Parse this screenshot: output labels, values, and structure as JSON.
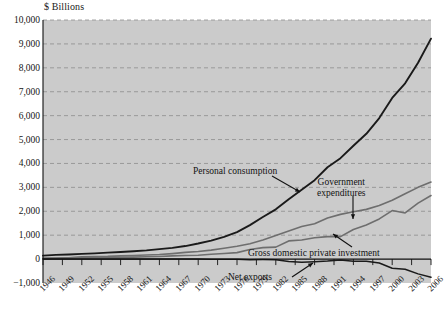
{
  "chart_data": {
    "type": "line",
    "title": "",
    "ylabel": "$ Billions",
    "xlabel": "",
    "ylim": [
      -1000,
      10000
    ],
    "xlim": [
      1946,
      2006
    ],
    "grid": true,
    "legend_position": "inline-annotations",
    "ytick_labels": [
      "10,000",
      "9,000",
      "8,000",
      "7,000",
      "6,000",
      "5,000",
      "4,000",
      "3,000",
      "2,000",
      "1,000",
      "0",
      "−1,000"
    ],
    "ytick_values": [
      10000,
      9000,
      8000,
      7000,
      6000,
      5000,
      4000,
      3000,
      2000,
      1000,
      0,
      -1000
    ],
    "xtick_labels": [
      "1946",
      "1949",
      "1952",
      "1955",
      "1958",
      "1961",
      "1964",
      "1967",
      "1970",
      "1973",
      "1976",
      "1979",
      "1982",
      "1985",
      "1988",
      "1991",
      "1994",
      "1997",
      "2000",
      "2003",
      "2006"
    ],
    "xtick_values": [
      1946,
      1949,
      1952,
      1955,
      1958,
      1961,
      1964,
      1967,
      1970,
      1973,
      1976,
      1979,
      1982,
      1985,
      1988,
      1991,
      1994,
      1997,
      2000,
      2003,
      2006
    ],
    "x": [
      1946,
      1948,
      1950,
      1952,
      1954,
      1956,
      1958,
      1960,
      1962,
      1964,
      1966,
      1968,
      1970,
      1972,
      1974,
      1976,
      1978,
      1980,
      1982,
      1984,
      1986,
      1988,
      1990,
      1992,
      1994,
      1996,
      1998,
      2000,
      2002,
      2004,
      2006
    ],
    "series": [
      {
        "name": "Personal consumption",
        "color": "#1a1a1a",
        "values": [
          145,
          175,
          195,
          220,
          240,
          270,
          295,
          330,
          365,
          415,
          470,
          545,
          650,
          770,
          930,
          1130,
          1420,
          1760,
          2080,
          2500,
          2900,
          3300,
          3840,
          4220,
          4740,
          5240,
          5900,
          6740,
          7350,
          8210,
          9220
        ]
      },
      {
        "name": "Government expenditures",
        "color": "#6e6e6e",
        "values": [
          30,
          38,
          50,
          95,
          110,
          115,
          135,
          150,
          170,
          190,
          230,
          280,
          320,
          375,
          455,
          540,
          640,
          800,
          990,
          1180,
          1360,
          1480,
          1720,
          1870,
          1980,
          2080,
          2240,
          2460,
          2730,
          3000,
          3220
        ]
      },
      {
        "name": "Gross domestic private investment",
        "color": "#6e6e6e",
        "values": [
          35,
          48,
          58,
          62,
          65,
          75,
          70,
          82,
          95,
          110,
          135,
          150,
          160,
          200,
          235,
          270,
          400,
          480,
          500,
          760,
          800,
          890,
          940,
          940,
          1240,
          1430,
          1680,
          2030,
          1930,
          2340,
          2660
        ]
      },
      {
        "name": "Net exports",
        "color": "#1a1a1a",
        "values": [
          8,
          6,
          2,
          3,
          2,
          5,
          1,
          4,
          4,
          7,
          4,
          1,
          4,
          -3,
          -2,
          -4,
          -24,
          -20,
          -27,
          -102,
          -132,
          -107,
          -78,
          -35,
          -93,
          -95,
          -164,
          -380,
          -424,
          -618,
          -762
        ]
      }
    ],
    "annotations": [
      {
        "name": "personal-consumption",
        "text": "Personal consumption"
      },
      {
        "name": "government-expenditures",
        "text": "Government expenditures"
      },
      {
        "name": "gross-domestic-private-investment",
        "text": "Gross domestic private investment"
      },
      {
        "name": "net-exports",
        "text": "Net exports"
      }
    ]
  },
  "annotation_text": {
    "personal_consumption": "Personal consumption",
    "government_expenditures_line1": "Government",
    "government_expenditures_line2": "expenditures",
    "gross_domestic_private_investment": "Gross domestic private investment",
    "net_exports": "Net exports"
  },
  "colors": {
    "plot_background": "#cbcbcb",
    "page_background": "#ffffff",
    "grid": "#8d8d8d",
    "dark_series": "#1a1a1a",
    "gray_series": "#6e6e6e",
    "axis": "#111111"
  }
}
